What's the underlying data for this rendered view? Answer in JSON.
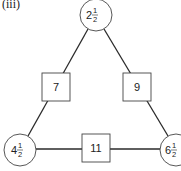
{
  "figure": {
    "label": "(iii)",
    "circles": [
      {
        "id": "top",
        "whole": "2",
        "num": "1",
        "den": "2",
        "cx": 96,
        "cy": 15,
        "r": 16
      },
      {
        "id": "left",
        "whole": "4",
        "num": "1",
        "den": "2",
        "cx": 20,
        "cy": 150,
        "r": 16
      },
      {
        "id": "right",
        "whole": "6",
        "num": "1",
        "den": "2",
        "cx": 176,
        "cy": 150,
        "r": 16
      }
    ],
    "squares": [
      {
        "id": "left-side",
        "value": "7",
        "cx": 56,
        "cy": 87,
        "size": 28
      },
      {
        "id": "right-side",
        "value": "9",
        "cx": 137,
        "cy": 87,
        "size": 28
      },
      {
        "id": "bottom-side",
        "value": "11",
        "cx": 96,
        "cy": 148,
        "size": 28
      }
    ],
    "colors": {
      "stroke": "#444444",
      "edge": "#2a2a2a",
      "text": "#222222",
      "background": "#ffffff"
    }
  }
}
